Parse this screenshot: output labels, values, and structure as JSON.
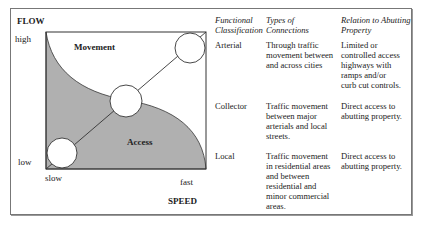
{
  "diagram": {
    "y_axis_title": "FLOW",
    "y_high": "high",
    "y_low": "low",
    "x_axis_title": "SPEED",
    "x_slow": "slow",
    "x_fast": "fast",
    "region_top": "Movement",
    "region_bottom": "Access",
    "colors": {
      "access_fill": "#b0b0b0",
      "line": "#333333",
      "border": "#777777"
    }
  },
  "table": {
    "headers": [
      "Functional Classification",
      "Types of Connections",
      "Relation to Abutting Property"
    ],
    "header_lines": [
      [
        "Functional",
        "Classification"
      ],
      [
        "Types of",
        "Connections"
      ],
      [
        "Relation to Abutting",
        "Property"
      ]
    ],
    "rows": [
      {
        "classification": "Arterial",
        "connections": [
          "Through traffic",
          "movement between",
          "and across cities"
        ],
        "relation": [
          "Limited or",
          "controlled access",
          "highways with",
          "ramps and/or",
          "curb cut controls."
        ]
      },
      {
        "classification": "Collector",
        "connections": [
          "Traffic movement",
          "between major",
          "arterials and local",
          "streets."
        ],
        "relation": [
          "Direct access to",
          "abutting property."
        ]
      },
      {
        "classification": "Local",
        "connections": [
          "Traffic movement",
          "in residential areas",
          "and between",
          "residential and",
          "minor commercial",
          "areas."
        ],
        "relation": [
          "Direct access to",
          "abutting property."
        ]
      }
    ]
  }
}
